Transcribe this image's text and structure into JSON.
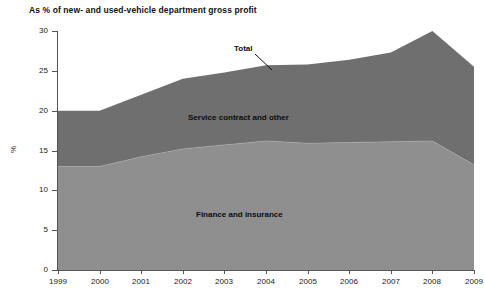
{
  "chart_data": {
    "type": "area",
    "stacked": true,
    "title": "As % of new- and used-vehicle department gross profit",
    "xlabel": "",
    "ylabel": "%",
    "ylim": [
      0,
      30
    ],
    "ytick_step": 5,
    "yticks": [
      0,
      5,
      10,
      15,
      20,
      25,
      30
    ],
    "grid": false,
    "legend": "inline-area-labels",
    "categories": [
      "1999",
      "2000",
      "2001",
      "2002",
      "2003",
      "2004",
      "2005",
      "2006",
      "2007",
      "2008",
      "2009"
    ],
    "series": [
      {
        "name": "Finance and insurance",
        "color": "#8f8f8f",
        "values": [
          13.0,
          13.0,
          14.2,
          15.2,
          15.7,
          16.2,
          15.9,
          16.0,
          16.1,
          16.2,
          13.2
        ]
      },
      {
        "name": "Service contract and other",
        "color": "#6f6f6f",
        "values": [
          7.0,
          7.0,
          7.8,
          8.8,
          9.1,
          9.5,
          9.9,
          10.4,
          11.2,
          13.8,
          12.3
        ]
      }
    ],
    "total": {
      "name": "Total",
      "values": [
        20.0,
        20.0,
        22.0,
        24.0,
        24.8,
        25.7,
        25.8,
        26.4,
        27.3,
        30.0,
        25.5
      ]
    },
    "annotations": [
      {
        "name": "total-callout",
        "text": "Total",
        "points_to_year": 2004
      },
      {
        "name": "service-area-label",
        "text": "Service contract and other"
      },
      {
        "name": "fi-area-label",
        "text": "Finance and insurance"
      }
    ]
  },
  "labels": {
    "title": "As % of new- and used-vehicle department gross profit",
    "y_axis_title": "%",
    "total": "Total",
    "service": "Service contract and other",
    "finance": "Finance and insurance"
  },
  "yticks": [
    "30",
    "25",
    "20",
    "15",
    "10",
    "5",
    "0"
  ],
  "xticks": [
    "1999",
    "2000",
    "2001",
    "2002",
    "2003",
    "2004",
    "2005",
    "2006",
    "2007",
    "2008",
    "2009"
  ]
}
